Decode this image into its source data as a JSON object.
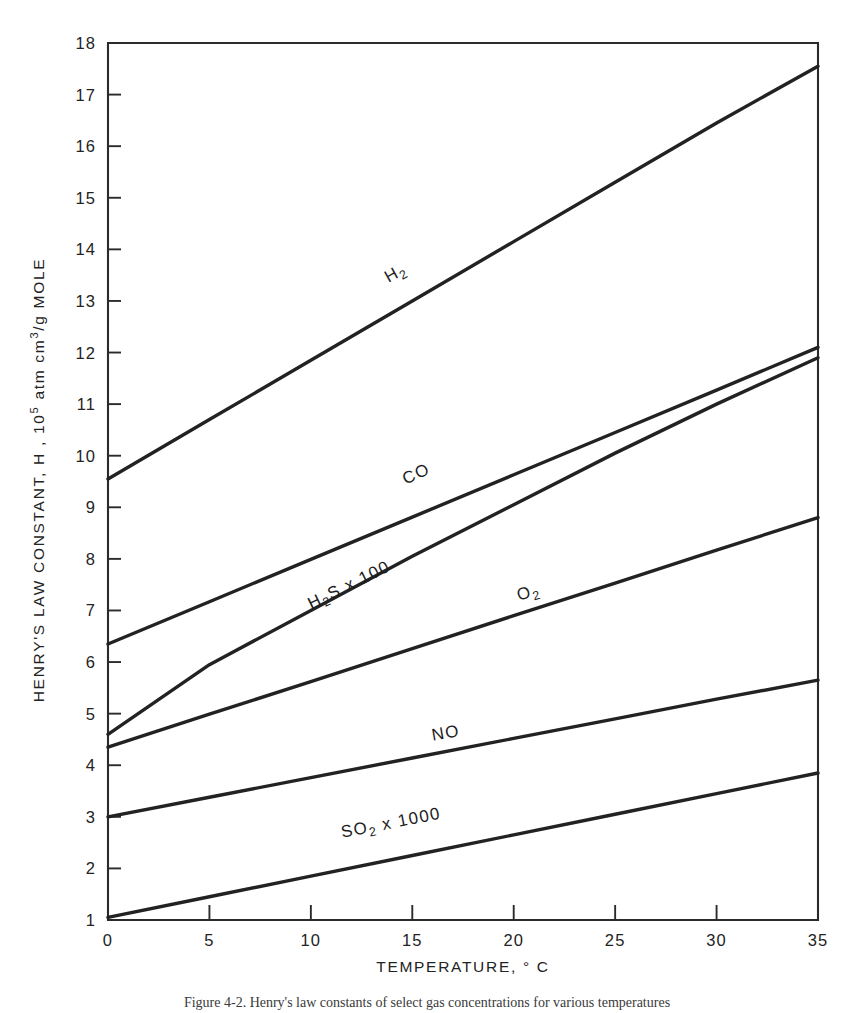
{
  "figure": {
    "caption": "Figure 4-2. Henry's law constants of select gas concentrations for various temperatures"
  },
  "chart_data": {
    "type": "line",
    "title": "",
    "xlabel": "TEMPERATURE, ° C",
    "ylabel_parts": {
      "pre": "HENRY'S LAW CONSTANT, H , 10",
      "exp1": "5",
      "mid": " atm  cm",
      "exp2": "3",
      "post": "/g MOLE"
    },
    "ylabel": "HENRY'S LAW CONSTANT, H , 10^5 atm cm^3/g MOLE",
    "xlim": [
      0,
      35
    ],
    "ylim": [
      1,
      18
    ],
    "xticks": [
      0,
      5,
      10,
      15,
      20,
      25,
      30,
      35
    ],
    "yticks": [
      1,
      2,
      3,
      4,
      5,
      6,
      7,
      8,
      9,
      10,
      11,
      12,
      13,
      14,
      15,
      16,
      17,
      18
    ],
    "xtick_labels": [
      "0",
      "5",
      "10",
      "15",
      "20",
      "25",
      "30",
      "35"
    ],
    "ytick_labels": [
      "1",
      "2",
      "3",
      "4",
      "5",
      "6",
      "7",
      "8",
      "9",
      "10",
      "11",
      "12",
      "13",
      "14",
      "15",
      "16",
      "17",
      "18"
    ],
    "grid": false,
    "legend_position": "inline-labels",
    "line_color": "#222222",
    "axis_color": "#2b2b2b",
    "background": "#ffffff",
    "x": [
      0,
      5,
      10,
      15,
      20,
      25,
      30,
      35
    ],
    "series": [
      {
        "name": "H2",
        "label_text": "H2",
        "label_base": "H",
        "label_sub": "2",
        "label_suffix": "",
        "label_x": 14.3,
        "label_y": 13.45,
        "label_rotation": -29,
        "values": [
          9.55,
          10.7,
          11.85,
          13.0,
          14.15,
          15.3,
          16.45,
          17.55
        ]
      },
      {
        "name": "CO",
        "label_text": "CO",
        "label_base": "CO",
        "label_sub": "",
        "label_suffix": "",
        "label_x": 15.3,
        "label_y": 9.55,
        "label_rotation": -24,
        "values": [
          6.35,
          7.17,
          7.99,
          8.81,
          9.63,
          10.45,
          11.27,
          12.1
        ]
      },
      {
        "name": "H2S x 100",
        "label_text": "H2S x 100",
        "label_base": "H",
        "label_sub": "2",
        "label_suffix": "S x 100",
        "label_x": 12.0,
        "label_y": 7.4,
        "label_rotation": -26,
        "values": [
          4.6,
          5.95,
          7.0,
          8.05,
          9.05,
          10.05,
          11.0,
          11.9
        ]
      },
      {
        "name": "O2",
        "label_text": "O2",
        "label_base": "O",
        "label_sub": "2",
        "label_suffix": "",
        "label_x": 20.8,
        "label_y": 7.25,
        "label_rotation": -16,
        "values": [
          4.35,
          4.99,
          5.62,
          6.26,
          6.9,
          7.53,
          8.17,
          8.8
        ]
      },
      {
        "name": "NO",
        "label_text": "NO",
        "label_base": "NO",
        "label_sub": "",
        "label_suffix": "",
        "label_x": 16.7,
        "label_y": 4.52,
        "label_rotation": -10,
        "values": [
          3.0,
          3.38,
          3.76,
          4.14,
          4.52,
          4.9,
          5.28,
          5.65
        ]
      },
      {
        "name": "SO2 x 1000",
        "label_text": "SO2 x 1000",
        "label_base": "SO",
        "label_sub": "2",
        "label_suffix": " x 1000",
        "label_x": 14.0,
        "label_y": 2.78,
        "label_rotation": -11,
        "values": [
          1.05,
          1.45,
          1.85,
          2.25,
          2.65,
          3.05,
          3.45,
          3.85
        ]
      }
    ]
  }
}
